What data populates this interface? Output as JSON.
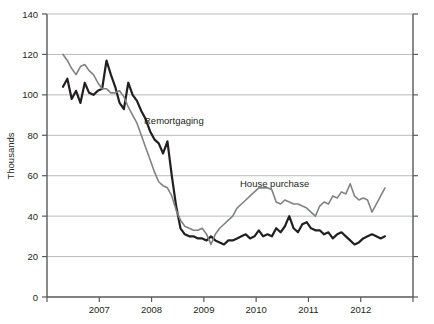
{
  "chart_data": {
    "type": "line",
    "title": "",
    "subtitle": "",
    "xlabel": "",
    "ylabel": "Thousands",
    "ylim": [
      0,
      140
    ],
    "ytick_step": 20,
    "yticks": [
      "0",
      "20",
      "40",
      "60",
      "80",
      "100",
      "120",
      "140"
    ],
    "xticks": [
      "2007",
      "2008",
      "2009",
      "2010",
      "2011",
      "2012"
    ],
    "xlim_note": "monthly data from mid-2006 to late 2012",
    "grid": "horizontal",
    "legend_position": "inline-annotations",
    "colors": {
      "remortgaging": "#231f20",
      "house_purchase": "#808285",
      "grid": "#a7a9ac",
      "axis": "#58595b",
      "background": "#ffffff"
    },
    "series": [
      {
        "name": "Remortgaging",
        "color": "#231f20",
        "stroke_width": 2.2,
        "label_x": 144,
        "label_y": 124,
        "values": [
          104,
          108,
          98,
          102,
          96,
          106,
          101,
          100,
          102,
          103,
          117,
          110,
          104,
          96,
          93,
          106,
          100,
          97,
          92,
          88,
          82,
          78,
          76,
          71,
          77,
          60,
          45,
          34,
          31,
          30,
          30,
          29,
          29,
          28,
          30,
          28,
          27,
          26,
          28,
          28,
          29,
          30,
          31,
          29,
          30,
          33,
          30,
          31,
          30,
          34,
          32,
          35,
          40,
          34,
          32,
          36,
          37,
          34,
          33,
          33,
          31,
          32,
          29,
          31,
          32,
          30,
          28,
          26,
          27,
          29,
          30,
          31,
          30,
          29,
          30
        ]
      },
      {
        "name": "House purchase",
        "color": "#808285",
        "stroke_width": 1.6,
        "label_x": 240,
        "label_y": 187,
        "values": [
          120,
          117,
          113,
          110,
          114,
          115,
          112,
          110,
          106,
          103,
          103,
          101,
          101,
          102,
          99,
          94,
          90,
          86,
          80,
          74,
          68,
          62,
          57,
          55,
          54,
          50,
          43,
          38,
          35,
          34,
          33,
          33,
          34,
          31,
          26,
          31,
          34,
          36,
          38,
          40,
          44,
          46,
          48,
          50,
          52,
          54,
          54,
          54,
          53,
          47,
          46,
          48,
          47,
          46,
          46,
          45,
          44,
          42,
          40,
          45,
          47,
          46,
          50,
          49,
          52,
          51,
          56,
          50,
          48,
          49,
          48,
          42,
          46,
          50,
          54
        ]
      }
    ]
  }
}
